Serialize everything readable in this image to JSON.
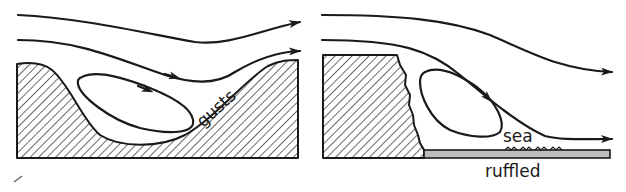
{
  "figure": {
    "panels": [
      {
        "id": "left",
        "description": "Airflow over a valley between hills with a recirculating eddy",
        "labels": {
          "gusts": "gusts"
        }
      },
      {
        "id": "right",
        "description": "Airflow down a cliff onto the sea with a lee eddy",
        "labels": {
          "sea": "sea",
          "ruffled": "ruffled"
        }
      }
    ],
    "colors": {
      "ink": "#1a1a1a",
      "background": "#ffffff",
      "sea": "#bdbdbd"
    }
  }
}
